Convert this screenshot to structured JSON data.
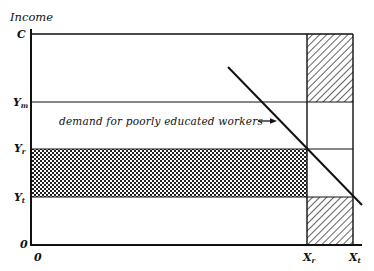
{
  "diagram": {
    "type": "economic income diagram",
    "y_axis_title": "Income",
    "y_labels": [
      {
        "id": "C",
        "main": "C",
        "sub": ""
      },
      {
        "id": "Ym",
        "main": "Y",
        "sub": "m"
      },
      {
        "id": "Yr",
        "main": "Y",
        "sub": "r"
      },
      {
        "id": "Yt",
        "main": "Y",
        "sub": "t"
      },
      {
        "id": "zero",
        "main": "0",
        "sub": ""
      }
    ],
    "x_labels": [
      {
        "id": "zero",
        "main": "0",
        "sub": ""
      },
      {
        "id": "Xr",
        "main": "X",
        "sub": "r"
      },
      {
        "id": "Xt",
        "main": "X",
        "sub": "t"
      }
    ],
    "annotation": "demand for poorly educated workers",
    "regions": {
      "dotted_band": "between Y_r and Y_t from 0 to X_r",
      "hatched_top": "between C and Y_m from X_r to X_t",
      "hatched_bottom": "between Y_t and 0 from X_r to X_t"
    },
    "colors": {
      "line": "#111111",
      "background": "#ffffff"
    }
  }
}
